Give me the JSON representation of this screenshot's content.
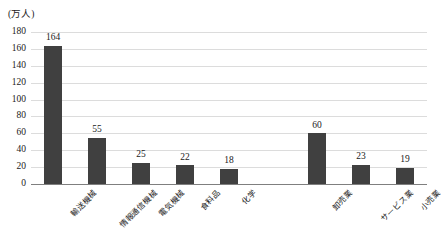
{
  "chart_data": {
    "type": "bar",
    "title": "",
    "subtitle": "",
    "xlabel": "",
    "ylabel": "(万人)",
    "unit_label": "(万人)",
    "ylim": [
      0,
      180
    ],
    "ytick_step": 20,
    "ytick_labels": [
      "180",
      "160",
      "140",
      "120",
      "100",
      "80",
      "60",
      "40",
      "20",
      "0"
    ],
    "ytick_values": [
      180,
      160,
      140,
      120,
      100,
      80,
      60,
      40,
      20,
      0
    ],
    "grid": true,
    "grid_axis": "y",
    "legend": false,
    "legend_position": "none",
    "bar_color": "#404040",
    "gridline_color": "#dcdcdc",
    "axis_color": "#7f7f7f",
    "text_color": "#1a1a1a",
    "categories": [
      "輸送機械",
      "情報通信機械",
      "電気機械",
      "食料品",
      "化学",
      "",
      "卸売業",
      "サービス業",
      "小売業"
    ],
    "values": [
      164,
      55,
      25,
      22,
      18,
      null,
      60,
      23,
      19
    ],
    "data_labels": [
      "164",
      "55",
      "25",
      "22",
      "18",
      "",
      "60",
      "23",
      "19"
    ],
    "annotations": []
  }
}
